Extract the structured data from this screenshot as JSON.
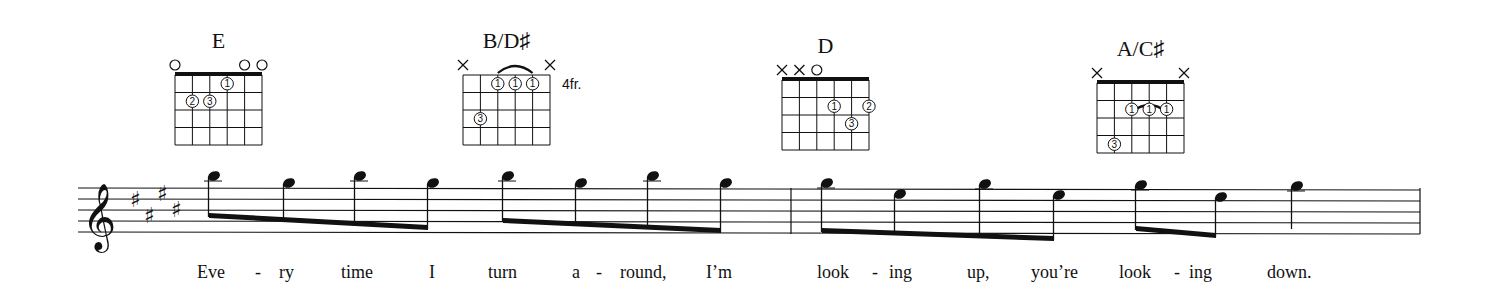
{
  "sheet": {
    "key_signature": "E major (4 sharps)",
    "clef": "treble",
    "clef_glyph": "𝄞",
    "sharp_glyph": "♯",
    "colors": {
      "ink": "#111111",
      "paper": "#ffffff"
    }
  },
  "chords": [
    {
      "name": "E",
      "x": 175,
      "top": 75,
      "base_fret_label": "",
      "markers": [
        "o",
        "",
        "",
        "",
        "o",
        "o"
      ],
      "fingers": [
        {
          "string": 3,
          "fret": 1,
          "finger": "1"
        },
        {
          "string": 1,
          "fret": 2,
          "finger": "2"
        },
        {
          "string": 2,
          "fret": 2,
          "finger": "3"
        }
      ],
      "barre": null
    },
    {
      "name": "B/D♯",
      "x": 463,
      "top": 75,
      "base_fret_label": "4fr.",
      "markers": [
        "x",
        "",
        "",
        "",
        "",
        "x"
      ],
      "fingers": [
        {
          "string": 2,
          "fret": 1,
          "finger": "1"
        },
        {
          "string": 3,
          "fret": 1,
          "finger": "1"
        },
        {
          "string": 4,
          "fret": 1,
          "finger": "1"
        },
        {
          "string": 1,
          "fret": 3,
          "finger": "3"
        }
      ],
      "barre": {
        "from": 2,
        "to": 4,
        "fret": 0
      }
    },
    {
      "name": "D",
      "x": 782,
      "top": 80,
      "base_fret_label": "",
      "markers": [
        "x",
        "x",
        "o",
        "",
        "",
        ""
      ],
      "fingers": [
        {
          "string": 3,
          "fret": 2,
          "finger": "1"
        },
        {
          "string": 5,
          "fret": 2,
          "finger": "2"
        },
        {
          "string": 4,
          "fret": 3,
          "finger": "3"
        }
      ],
      "barre": null
    },
    {
      "name": "A/C♯",
      "x": 1097,
      "top": 83,
      "base_fret_label": "",
      "markers": [
        "x",
        "",
        "",
        "",
        "",
        "x"
      ],
      "fingers": [
        {
          "string": 2,
          "fret": 2,
          "finger": "1"
        },
        {
          "string": 3,
          "fret": 2,
          "finger": "1"
        },
        {
          "string": 4,
          "fret": 2,
          "finger": "1"
        },
        {
          "string": 1,
          "fret": 4,
          "finger": "3"
        }
      ],
      "barre": {
        "from": 2,
        "to": 4,
        "fret": 1
      }
    }
  ],
  "staff": {
    "x_start": 78,
    "x_end": 1420,
    "top": 188,
    "spacing": 11,
    "barlines": [
      791,
      1420
    ]
  },
  "notes": [
    {
      "x": 213,
      "pitch": "B5",
      "y": 176,
      "ledger": true
    },
    {
      "x": 288,
      "pitch": "G#5",
      "y": 183,
      "ledger": false
    },
    {
      "x": 359,
      "pitch": "B5",
      "y": 176,
      "ledger": true
    },
    {
      "x": 432,
      "pitch": "G#5",
      "y": 183,
      "ledger": false
    },
    {
      "x": 507,
      "pitch": "B5",
      "y": 176,
      "ledger": true
    },
    {
      "x": 580,
      "pitch": "G#5",
      "y": 183,
      "ledger": false
    },
    {
      "x": 652,
      "pitch": "B5",
      "y": 176,
      "ledger": true
    },
    {
      "x": 725,
      "pitch": "G#5",
      "y": 183,
      "ledger": false
    },
    {
      "x": 826,
      "pitch": "A5",
      "y": 183,
      "ledger": true
    },
    {
      "x": 899,
      "pitch": "F#5",
      "y": 194,
      "ledger": false
    },
    {
      "x": 984,
      "pitch": "A5",
      "y": 184,
      "ledger": true
    },
    {
      "x": 1058,
      "pitch": "F#5",
      "y": 195,
      "ledger": false
    },
    {
      "x": 1140,
      "pitch": "A5",
      "y": 185,
      "ledger": true
    },
    {
      "x": 1220,
      "pitch": "F#5",
      "y": 197,
      "ledger": false
    },
    {
      "x": 1296,
      "pitch": "A5",
      "y": 186,
      "ledger": true
    }
  ],
  "beams": [
    {
      "from": 0,
      "to": 3,
      "y1": 213,
      "y2": 225
    },
    {
      "from": 4,
      "to": 7,
      "y1": 218,
      "y2": 228
    },
    {
      "from": 8,
      "to": 11,
      "y1": 228,
      "y2": 236
    },
    {
      "from": 12,
      "to": 13,
      "y1": 226,
      "y2": 233
    }
  ],
  "single_stems": [
    {
      "note": 14,
      "y_end": 225
    }
  ],
  "lyrics": [
    {
      "text": "Eve",
      "x": 197
    },
    {
      "text": "-",
      "x": 255
    },
    {
      "text": "ry",
      "x": 279
    },
    {
      "text": "time",
      "x": 341
    },
    {
      "text": "I",
      "x": 429
    },
    {
      "text": "turn",
      "x": 488
    },
    {
      "text": "a",
      "x": 572
    },
    {
      "text": "-",
      "x": 596
    },
    {
      "text": "round,",
      "x": 620
    },
    {
      "text": "I’m",
      "x": 706
    },
    {
      "text": "look",
      "x": 817
    },
    {
      "text": "-",
      "x": 872
    },
    {
      "text": "ing",
      "x": 889
    },
    {
      "text": "up,",
      "x": 967
    },
    {
      "text": "you’re",
      "x": 1031
    },
    {
      "text": "look",
      "x": 1119
    },
    {
      "text": "-",
      "x": 1174
    },
    {
      "text": "ing",
      "x": 1189
    },
    {
      "text": "down.",
      "x": 1267
    }
  ],
  "lyrics_y": 278
}
